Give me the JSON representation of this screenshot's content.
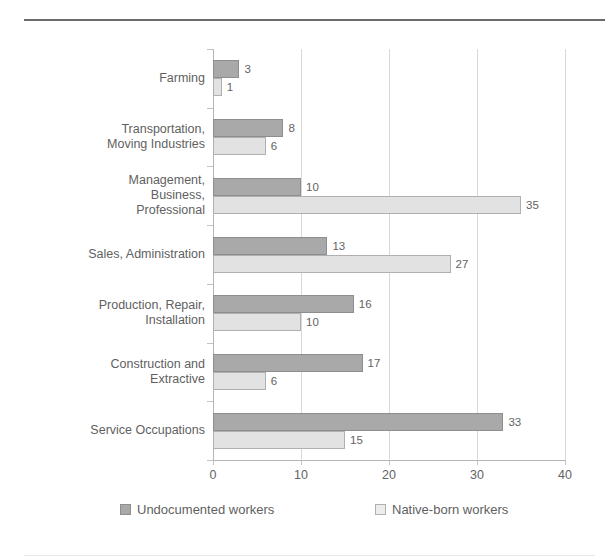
{
  "chart_data": {
    "type": "bar",
    "orientation": "horizontal",
    "title": "",
    "xlabel": "",
    "ylabel": "",
    "xlim": [
      0,
      40
    ],
    "xticks": [
      "0",
      "10",
      "20",
      "30",
      "40"
    ],
    "grid": "vertical",
    "legend_position": "bottom",
    "categories": [
      "Farming",
      "Transportation,\nMoving Industries",
      "Management,\nBusiness,\nProfessional",
      "Sales, Administration",
      "Production, Repair,\nInstallation",
      "Construction and\nExtractive",
      "Service Occupations"
    ],
    "series": [
      {
        "name": "Undocumented workers",
        "color": "#a9a9a9",
        "values": [
          3,
          8,
          10,
          13,
          16,
          17,
          33
        ]
      },
      {
        "name": "Native-born workers",
        "color": "#e2e2e2",
        "values": [
          1,
          6,
          35,
          27,
          10,
          6,
          15
        ]
      }
    ]
  },
  "legend": {
    "items": [
      {
        "label": "Undocumented workers",
        "swatch": "dark"
      },
      {
        "label": "Native-born workers",
        "swatch": "light"
      }
    ]
  }
}
